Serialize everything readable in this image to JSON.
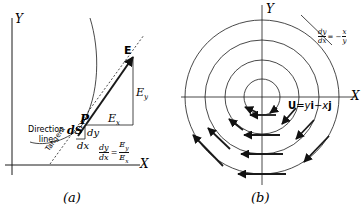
{
  "figure_a": {
    "caption": "(a)",
    "axis_x": "X",
    "axis_y": "Y",
    "point_p": "P",
    "vector_e": "E",
    "component_ex": "Ex",
    "component_ey": "Ey",
    "element_ds": "dS",
    "dx": "dx",
    "dy": "dy",
    "direction_line_1": "Direction",
    "direction_line_2": "line",
    "tangent": "Tangent",
    "equation_lhs_num": "dy",
    "equation_lhs_den": "dx",
    "equation_rhs_num": "Ey",
    "equation_rhs_den": "Ex"
  },
  "figure_b": {
    "caption": "(b)",
    "axis_x": "X",
    "axis_y": "Y",
    "field_label": "U = yi − xj",
    "slope_num": "dy",
    "slope_den": "dx",
    "slope_rhs_num": "x",
    "slope_rhs_den": "y",
    "slope_sign": "= −"
  }
}
